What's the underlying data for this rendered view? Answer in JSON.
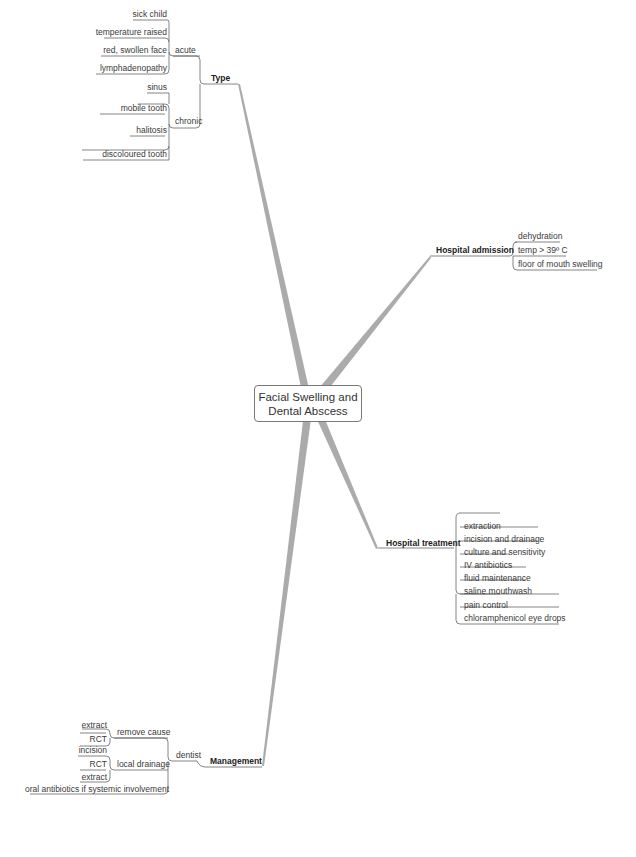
{
  "central_topic": {
    "line1": "Facial Swelling and",
    "line2": "Dental Abscess"
  },
  "branches": {
    "type": {
      "label": "Type",
      "acute": {
        "label": "acute",
        "items": [
          "sick child",
          "temperature raised",
          "red, swollen face",
          "lymphadenopathy"
        ]
      },
      "chronic": {
        "label": "chronic",
        "items": [
          "sinus",
          "mobile tooth",
          "halitosis",
          "discoloured tooth"
        ]
      }
    },
    "hospital_admission": {
      "label": "Hospital admission",
      "items": [
        "dehydration",
        "temp > 39º C",
        "floor of mouth swelling"
      ]
    },
    "hospital_treatment": {
      "label": "Hospital treatment",
      "items": [
        "extraction",
        "incision and drainage",
        "culture and sensitivity",
        "IV antibiotics",
        "fluid maintenance",
        "saline mouthwash",
        "pain control",
        "chloramphenicol eye drops"
      ]
    },
    "management": {
      "label": "Management",
      "dentist": {
        "label": "dentist",
        "remove_cause": {
          "label": "remove cause",
          "items": [
            "extract",
            "RCT"
          ]
        },
        "local_drainage": {
          "label": "local drainage",
          "items": [
            "incision",
            "RCT",
            "extract"
          ]
        },
        "oral_antibiotics": "oral antibiotics if systemic involvement"
      }
    }
  },
  "colors": {
    "branch": "#aaaaaa",
    "line": "#555555",
    "background": "#ffffff"
  }
}
